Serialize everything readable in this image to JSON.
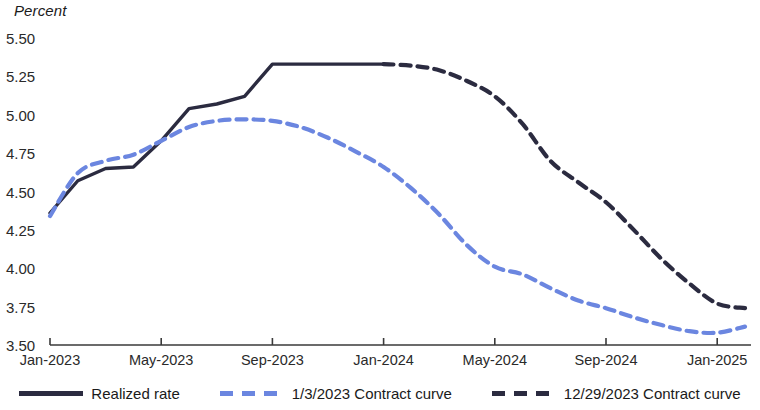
{
  "chart_data": {
    "type": "line",
    "title": "",
    "subtitle": "",
    "xlabel": "",
    "ylabel": "Percent",
    "unit_label": "Percent",
    "ylim": [
      3.5,
      5.5
    ],
    "y_ticks": [
      "5.50",
      "5.25",
      "5.00",
      "4.75",
      "4.50",
      "4.25",
      "4.00",
      "3.75",
      "3.50"
    ],
    "y_tick_values": [
      5.5,
      5.25,
      5.0,
      4.75,
      4.5,
      4.25,
      4.0,
      3.75,
      3.5
    ],
    "x_ticks": [
      "Jan-2023",
      "May-2023",
      "Sep-2023",
      "Jan-2024",
      "May-2024",
      "Sep-2024",
      "Jan-2025"
    ],
    "x_tick_months": [
      0,
      4,
      8,
      12,
      16,
      20,
      24
    ],
    "xlim_months": [
      0,
      25
    ],
    "grid": false,
    "legend_position": "bottom",
    "colors": {
      "realized": "#2b2b40",
      "contract_2023": "#6b86e0",
      "contract_2024": "#2b2b40",
      "axis": "#3a3a3a",
      "text": "#1a1a1a"
    },
    "series": [
      {
        "name": "Realized rate",
        "key": "realized",
        "color": "#2b2b40",
        "style": "solid",
        "x_months": [
          0,
          1,
          2,
          3,
          4,
          5,
          6,
          7,
          8,
          9,
          10,
          11,
          12
        ],
        "values": [
          4.36,
          4.57,
          4.65,
          4.66,
          4.83,
          5.04,
          5.07,
          5.12,
          5.33,
          5.33,
          5.33,
          5.33,
          5.33
        ]
      },
      {
        "name": "1/3/2023 Contract curve",
        "key": "contract_2023",
        "color": "#6b86e0",
        "style": "dashed",
        "x_months": [
          0,
          1,
          2,
          3,
          4,
          5,
          6,
          7,
          8,
          9,
          10,
          11,
          12,
          13,
          14,
          15,
          16,
          17,
          18,
          19,
          20,
          21,
          22,
          23,
          24,
          25
        ],
        "values": [
          4.34,
          4.62,
          4.7,
          4.74,
          4.83,
          4.92,
          4.96,
          4.97,
          4.96,
          4.92,
          4.85,
          4.76,
          4.66,
          4.52,
          4.35,
          4.15,
          4.01,
          3.96,
          3.87,
          3.79,
          3.74,
          3.68,
          3.63,
          3.59,
          3.58,
          3.62
        ]
      },
      {
        "name": "12/29/2023 Contract curve",
        "key": "contract_2024",
        "color": "#2b2b40",
        "style": "dashed",
        "x_months": [
          12,
          13,
          14,
          15,
          16,
          17,
          18,
          19,
          20,
          21,
          22,
          23,
          24,
          25
        ],
        "values": [
          5.33,
          5.32,
          5.29,
          5.22,
          5.12,
          4.94,
          4.7,
          4.56,
          4.43,
          4.25,
          4.06,
          3.9,
          3.77,
          3.74
        ]
      }
    ],
    "legend": [
      {
        "label": "Realized rate",
        "color": "#2b2b40",
        "style": "solid",
        "swatch": "solid-navy"
      },
      {
        "label": "1/3/2023 Contract curve",
        "color": "#6b86e0",
        "style": "dashed",
        "swatch": "dashed-blue"
      },
      {
        "label": "12/29/2023 Contract curve",
        "color": "#2b2b40",
        "style": "dashed",
        "swatch": "dashed-navy"
      }
    ]
  }
}
